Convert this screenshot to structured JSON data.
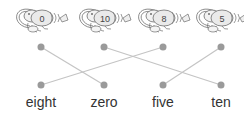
{
  "exercise": {
    "type": "matching",
    "shrimps": [
      {
        "number": "0",
        "x": 41
      },
      {
        "number": "10",
        "x": 104
      },
      {
        "number": "8",
        "x": 163
      },
      {
        "number": "5",
        "x": 221
      }
    ],
    "words": [
      {
        "label": "eight",
        "x": 41
      },
      {
        "label": "zero",
        "x": 104
      },
      {
        "label": "five",
        "x": 163
      },
      {
        "label": "ten",
        "x": 221
      }
    ],
    "connections": [
      {
        "from": "0",
        "to": "zero"
      },
      {
        "from": "10",
        "to": "ten"
      },
      {
        "from": "8",
        "to": "eight"
      },
      {
        "from": "5",
        "to": "five"
      }
    ],
    "colors": {
      "dot": "#9a9a9a",
      "line": "#c4c4c4",
      "outline": "#6f6f6f",
      "text": "#333333"
    }
  }
}
